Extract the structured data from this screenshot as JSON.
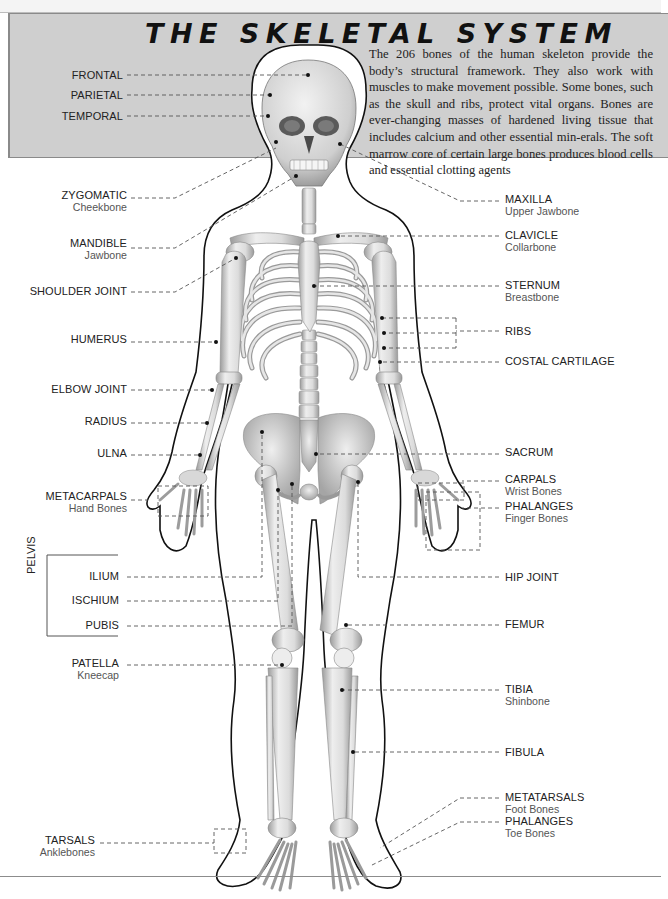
{
  "header": {
    "title": "THE SKELETAL SYSTEM",
    "intro": "The 206 bones of the human skeleton provide the body’s structural framework. They also work with muscles to make movement possible. Some bones, such as the skull and ribs, protect vital organs. Bones are ever-changing masses of hardened living tissue that includes calcium and other essential min-erals. The soft marrow core of certain large bones produces blood cells and essential clotting agents"
  },
  "labels_left": [
    {
      "name": "FRONTAL",
      "sub": ""
    },
    {
      "name": "PARIETAL",
      "sub": ""
    },
    {
      "name": "TEMPORAL",
      "sub": ""
    },
    {
      "name": "ZYGOMATIC",
      "sub": "Cheekbone"
    },
    {
      "name": "MANDIBLE",
      "sub": "Jawbone"
    },
    {
      "name": "SHOULDER JOINT",
      "sub": ""
    },
    {
      "name": "HUMERUS",
      "sub": ""
    },
    {
      "name": "ELBOW JOINT",
      "sub": ""
    },
    {
      "name": "RADIUS",
      "sub": ""
    },
    {
      "name": "ULNA",
      "sub": ""
    },
    {
      "name": "METACARPALS",
      "sub": "Hand Bones"
    },
    {
      "name": "ILIUM",
      "sub": ""
    },
    {
      "name": "ISCHIUM",
      "sub": ""
    },
    {
      "name": "PUBIS",
      "sub": ""
    },
    {
      "name": "PATELLA",
      "sub": "Kneecap"
    },
    {
      "name": "TARSALS",
      "sub": "Anklebones"
    }
  ],
  "pelvis_group_label": "PELVIS",
  "labels_right": [
    {
      "name": "MAXILLA",
      "sub": "Upper Jawbone"
    },
    {
      "name": "CLAVICLE",
      "sub": "Collarbone"
    },
    {
      "name": "STERNUM",
      "sub": "Breastbone"
    },
    {
      "name": "RIBS",
      "sub": ""
    },
    {
      "name": "COSTAL CARTILAGE",
      "sub": ""
    },
    {
      "name": "SACRUM",
      "sub": ""
    },
    {
      "name": "CARPALS",
      "sub": "Wrist Bones"
    },
    {
      "name": "PHALANGES",
      "sub": "Finger Bones"
    },
    {
      "name": "HIP JOINT",
      "sub": ""
    },
    {
      "name": "FEMUR",
      "sub": ""
    },
    {
      "name": "TIBIA",
      "sub": "Shinbone"
    },
    {
      "name": "FIBULA",
      "sub": ""
    },
    {
      "name": "METATARSALS",
      "sub": "Foot Bones"
    },
    {
      "name": "PHALANGES",
      "sub": "Toe Bones"
    }
  ],
  "colors": {
    "header_bg": "#cfcfcf",
    "bone": "#e4e4e4",
    "bone_shade": "#a9a9a9",
    "outline": "#111111",
    "leader": "#555555"
  }
}
